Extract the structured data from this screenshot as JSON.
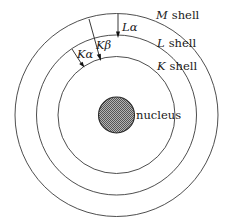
{
  "diagram": {
    "center": [
      116.5,
      115
    ],
    "nucleus": {
      "label": "nucleus",
      "radius": 18,
      "fill": "#8a8a8a",
      "stroke": "#2a2a2a"
    },
    "shells": [
      {
        "name": "K",
        "suffix": "shell",
        "radius": 58.5
      },
      {
        "name": "L",
        "suffix": "shell",
        "radius": 80
      },
      {
        "name": "M",
        "suffix": "shell",
        "radius": 101.5
      }
    ],
    "transitions": [
      {
        "name": "K",
        "greek": "α",
        "from": "L",
        "to": "K"
      },
      {
        "name": "K",
        "greek": "β",
        "from": "M",
        "to": "K"
      },
      {
        "name": "L",
        "greek": "α",
        "from": "M",
        "to": "L"
      }
    ],
    "colors": {
      "line": "#3a3a3a",
      "text": "#1a1a1a",
      "background": "#ffffff"
    }
  }
}
